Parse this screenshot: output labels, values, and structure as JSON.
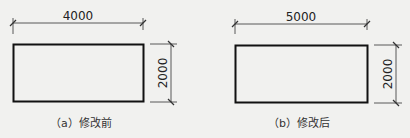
{
  "figures": [
    {
      "id": "a",
      "width_label": "4000",
      "height_label": "2000",
      "caption": "（a）修改前"
    },
    {
      "id": "b",
      "width_label": "5000",
      "height_label": "2000",
      "caption": "（b）修改后"
    }
  ],
  "colors": {
    "line": "#1a1a1a",
    "background": "#f1f1ef"
  }
}
